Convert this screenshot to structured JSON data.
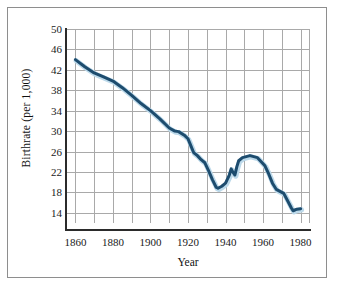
{
  "figure": {
    "background": "#ffffff",
    "frame_color": "#8e8e8e"
  },
  "chart_data": {
    "type": "line",
    "title": "",
    "subtitle": "",
    "xlabel": "Year",
    "ylabel": "Birthrate (per 1,000)",
    "xlim": [
      1855,
      1985
    ],
    "ylim": [
      12,
      50
    ],
    "grid": true,
    "legend": null,
    "legend_position": "none",
    "line_color": "#1d4c6e",
    "line_halo_color": "#bcd9ea",
    "line_width": 3,
    "x_ticks": [
      1860,
      1880,
      1900,
      1920,
      1940,
      1960,
      1980
    ],
    "x_tick_labels": [
      "1860",
      "1880",
      "1900",
      "1920",
      "1940",
      "1960",
      "1980"
    ],
    "x_minor_ticks": [
      1870,
      1890,
      1910,
      1930,
      1950,
      1970
    ],
    "y_ticks": [
      14,
      18,
      22,
      26,
      30,
      34,
      38,
      42,
      46,
      50
    ],
    "y_tick_labels": [
      "14",
      "18",
      "22",
      "26",
      "30",
      "34",
      "38",
      "42",
      "46",
      "50"
    ],
    "series": [
      {
        "name": "Birthrate",
        "x": [
          1860,
          1865,
          1870,
          1875,
          1880,
          1885,
          1890,
          1895,
          1900,
          1905,
          1910,
          1913,
          1915,
          1918,
          1920,
          1921,
          1923,
          1925,
          1927,
          1929,
          1931,
          1933,
          1935,
          1936,
          1938,
          1940,
          1942,
          1943,
          1944,
          1945,
          1946,
          1947,
          1949,
          1951,
          1953,
          1955,
          1957,
          1959,
          1961,
          1963,
          1965,
          1967,
          1969,
          1971,
          1973,
          1975,
          1976,
          1978,
          1980
        ],
        "values": [
          44.0,
          42.6,
          41.4,
          40.6,
          39.8,
          38.5,
          37.0,
          35.4,
          34.0,
          32.4,
          30.6,
          30.0,
          29.9,
          29.2,
          28.5,
          27.6,
          25.8,
          25.2,
          24.4,
          23.8,
          22.2,
          20.5,
          19.0,
          18.8,
          19.2,
          19.8,
          21.4,
          22.6,
          21.9,
          21.4,
          23.0,
          24.2,
          24.8,
          25.0,
          25.2,
          25.0,
          24.8,
          24.0,
          23.2,
          21.6,
          19.8,
          18.6,
          18.2,
          17.8,
          16.4,
          15.0,
          14.4,
          14.7,
          14.8
        ]
      }
    ]
  }
}
